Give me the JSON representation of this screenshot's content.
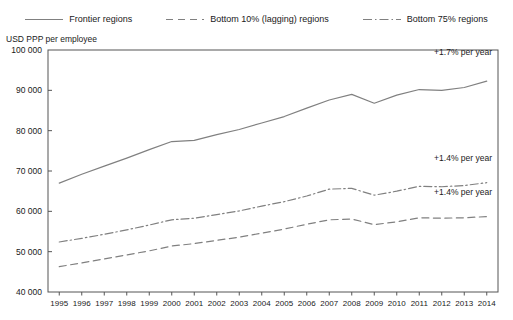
{
  "legend": {
    "items": [
      {
        "label": "Frontier regions",
        "style": "solid",
        "icon": "solid-line-icon"
      },
      {
        "label": "Bottom 10% (lagging) regions",
        "style": "dashed",
        "icon": "dashed-line-icon"
      },
      {
        "label": "Bottom 75% regions",
        "style": "dashdot",
        "icon": "dash-dot-line-icon"
      }
    ]
  },
  "axis": {
    "y_title": "USD PPP per employee",
    "y_ticks": [
      "40 000",
      "50 000",
      "60 000",
      "70 000",
      "80 000",
      "90 000",
      "100 000"
    ]
  },
  "annotations": [
    {
      "text": "+1.7% per year",
      "series": "Frontier regions"
    },
    {
      "text": "+1.4% per year",
      "series": "Bottom 75% regions"
    },
    {
      "text": "+1.4% per year",
      "series": "Bottom 10% (lagging) regions"
    }
  ],
  "colors": {
    "line": "#808080",
    "axis": "#555555",
    "text": "#1a1a1a"
  },
  "chart_data": {
    "type": "line",
    "title": "",
    "subtitle": "",
    "xlabel": "",
    "ylabel": "USD PPP per employee",
    "ylim": [
      40000,
      100000
    ],
    "ytick_values": [
      40000,
      50000,
      60000,
      70000,
      80000,
      90000,
      100000
    ],
    "grid": false,
    "legend_position": "top",
    "categories": [
      "1995",
      "1996",
      "1997",
      "1998",
      "1999",
      "2000",
      "2001",
      "2002",
      "2003",
      "2004",
      "2005",
      "2006",
      "2007",
      "2008",
      "2009",
      "2010",
      "2011",
      "2012",
      "2013",
      "2014"
    ],
    "x": [
      1995,
      1996,
      1997,
      1998,
      1999,
      2000,
      2001,
      2002,
      2003,
      2004,
      2005,
      2006,
      2007,
      2008,
      2009,
      2010,
      2011,
      2012,
      2013,
      2014
    ],
    "series": [
      {
        "name": "Frontier regions",
        "style": "solid",
        "annotation": "+1.7% per year",
        "values": [
          67000,
          69200,
          71200,
          73200,
          75300,
          77300,
          77600,
          79000,
          80300,
          81900,
          83500,
          85600,
          87600,
          89000,
          86800,
          88800,
          90200,
          90000,
          90700,
          92300
        ]
      },
      {
        "name": "Bottom 75% regions",
        "style": "dashdot",
        "annotation": "+1.4% per year",
        "values": [
          52400,
          53300,
          54300,
          55400,
          56600,
          57900,
          58300,
          59200,
          60100,
          61300,
          62400,
          63800,
          65500,
          65700,
          64000,
          65000,
          66200,
          66100,
          66400,
          67100
        ]
      },
      {
        "name": "Bottom 10% (lagging) regions",
        "style": "dashed",
        "annotation": "+1.4% per year",
        "values": [
          46300,
          47200,
          48200,
          49200,
          50200,
          51400,
          52000,
          52800,
          53600,
          54600,
          55600,
          56800,
          57900,
          58100,
          56700,
          57400,
          58400,
          58300,
          58400,
          58700
        ]
      }
    ]
  }
}
